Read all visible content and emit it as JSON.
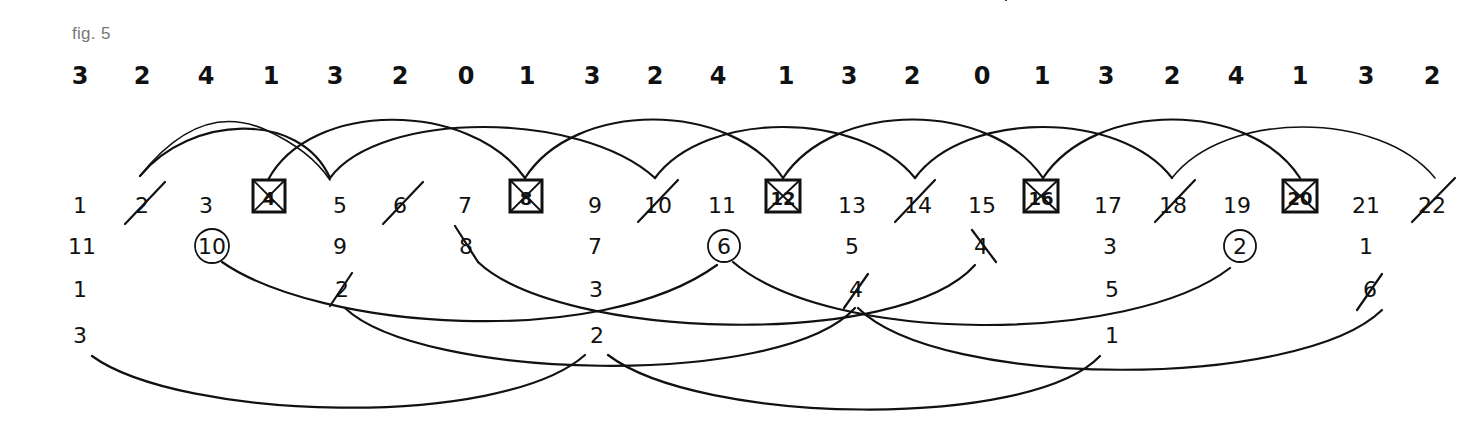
{
  "figure": {
    "label": "fig. 5",
    "top_sequence": [
      "3",
      "2",
      "4",
      "1",
      "3",
      "2",
      "0",
      "1",
      "3",
      "2",
      "4",
      "1",
      "3",
      "2",
      "0",
      "1",
      "3",
      "2",
      "4",
      "1",
      "3",
      "2"
    ],
    "number_row": {
      "values": [
        "1",
        "2",
        "3",
        "4",
        "5",
        "6",
        "7",
        "8",
        "9",
        "10",
        "11",
        "12",
        "13",
        "14",
        "15",
        "16",
        "17",
        "18",
        "19",
        "20",
        "21",
        "22"
      ],
      "boxed_crossed": [
        "4",
        "8",
        "12",
        "16",
        "20"
      ],
      "slashed": [
        "2",
        "6",
        "10",
        "14",
        "18",
        "22"
      ]
    },
    "descending_row": {
      "values": [
        "11",
        "10",
        "9",
        "8",
        "7",
        "6",
        "5",
        "4",
        "3",
        "2",
        "1"
      ],
      "circled": [
        "10",
        "6",
        "2"
      ],
      "slashed": [
        "8",
        "4"
      ]
    },
    "ascending_row": {
      "values": [
        "1",
        "2",
        "3",
        "4",
        "5",
        "6"
      ],
      "slashed": [
        "2",
        "4",
        "6"
      ]
    },
    "final_row": {
      "values": [
        "3",
        "2",
        "1"
      ]
    },
    "upper_arcs": [
      {
        "from": "2",
        "to": "6"
      },
      {
        "from": "4",
        "to": "8"
      },
      {
        "from": "6",
        "to": "10"
      },
      {
        "from": "8",
        "to": "12"
      },
      {
        "from": "10",
        "to": "14"
      },
      {
        "from": "12",
        "to": "16"
      },
      {
        "from": "14",
        "to": "18"
      },
      {
        "from": "16",
        "to": "20"
      },
      {
        "from": "18",
        "to": "22"
      }
    ],
    "lower_arcs_a": [
      {
        "from": "10",
        "to": "6"
      },
      {
        "from": "8",
        "to": "4"
      },
      {
        "from": "6",
        "to": "2"
      }
    ],
    "lower_arcs_b": [
      {
        "from": "2 (row 1..6)",
        "to": "4 (row 1..6)"
      },
      {
        "from": "4 (row 1..6)",
        "to": "6 (row 1..6)"
      },
      {
        "from": "3 (row 3,2,1)",
        "to": "2 (row 3,2,1)"
      },
      {
        "from": "2 (row 3,2,1)",
        "to": "1 (row 3,2,1)"
      }
    ],
    "colors": {
      "ink": "#111111",
      "label": "#777777",
      "background": "#ffffff"
    }
  }
}
